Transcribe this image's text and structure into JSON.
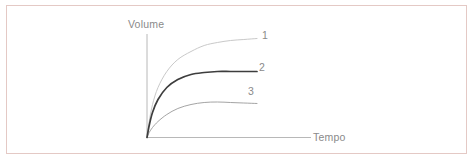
{
  "figure": {
    "frame_color": "#e4c9c5",
    "background_color": "#ffffff"
  },
  "chart_data": {
    "type": "line",
    "title": "",
    "subtitle": "",
    "xlabel": "Tempo",
    "ylabel": "Volume",
    "xlim": [
      0,
      1
    ],
    "ylim": [
      0,
      1
    ],
    "grid": false,
    "legend_position": "curve-end-labels",
    "axis_ticks": false,
    "tick_labels": {
      "x": [],
      "y": []
    },
    "annotations": [
      "1",
      "2",
      "3"
    ],
    "x": [
      0,
      0.02,
      0.05,
      0.1,
      0.18,
      0.28,
      0.4,
      0.52,
      0.64,
      0.76,
      0.88,
      1.0
    ],
    "series": [
      {
        "name": "1",
        "label": "1",
        "color": "#c9c9c9",
        "width": 1.0,
        "description": "highest saturating curve",
        "values": [
          0,
          0.16,
          0.33,
          0.5,
          0.66,
          0.78,
          0.86,
          0.92,
          0.95,
          0.97,
          0.98,
          0.99
        ]
      },
      {
        "name": "2",
        "label": "2",
        "color": "#3d3d3d",
        "width": 1.7,
        "description": "middle saturating curve, darkest line",
        "values": [
          0,
          0.12,
          0.25,
          0.38,
          0.5,
          0.58,
          0.63,
          0.65,
          0.66,
          0.66,
          0.66,
          0.66
        ]
      },
      {
        "name": "3",
        "label": "3",
        "color": "#9a9a9a",
        "width": 0.9,
        "description": "lowest curve, peaks then slightly declines",
        "values": [
          0,
          0.05,
          0.1,
          0.16,
          0.23,
          0.29,
          0.33,
          0.35,
          0.355,
          0.35,
          0.345,
          0.34
        ]
      }
    ]
  },
  "labels": {
    "y_axis_title": "Volume",
    "x_axis_title": "Tempo",
    "series_1": "1",
    "series_2": "2",
    "series_3": "3"
  },
  "icons": {
    "y_axis": "vertical-axis-line",
    "x_axis": "horizontal-axis-line"
  }
}
